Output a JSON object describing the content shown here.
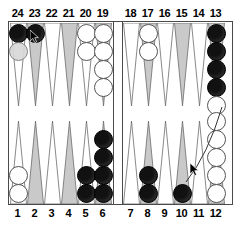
{
  "app": {
    "title": "Backgammon Board",
    "board_width": 242,
    "board_height": 227
  },
  "colors": {
    "board_background": "#ffffff",
    "border": "#4a4a4a",
    "point_shaded": "#c9c9c9",
    "point_plain": "#ffffff",
    "checker_dark": "#111111",
    "checker_light": "#ffffff",
    "checker_ghost": "#d8d8d8",
    "label_text": "#000000",
    "drag_line": "#333333"
  },
  "labels": {
    "top": [
      "24",
      "23",
      "22",
      "21",
      "20",
      "19",
      "18",
      "17",
      "16",
      "15",
      "14",
      "13"
    ],
    "bottom": [
      "1",
      "2",
      "3",
      "4",
      "5",
      "6",
      "7",
      "8",
      "9",
      "10",
      "11",
      "12"
    ]
  },
  "points": [
    {
      "number": "24",
      "row": "top",
      "quadrant": "left",
      "index": 0,
      "shaded": false,
      "checkers": [
        {
          "color": "dark"
        },
        {
          "color": "ghost"
        }
      ]
    },
    {
      "number": "23",
      "row": "top",
      "quadrant": "left",
      "index": 1,
      "shaded": true,
      "checkers": [
        {
          "color": "dark"
        }
      ]
    },
    {
      "number": "22",
      "row": "top",
      "quadrant": "left",
      "index": 2,
      "shaded": false,
      "checkers": []
    },
    {
      "number": "21",
      "row": "top",
      "quadrant": "left",
      "index": 3,
      "shaded": true,
      "checkers": []
    },
    {
      "number": "20",
      "row": "top",
      "quadrant": "left",
      "index": 4,
      "shaded": false,
      "checkers": [
        {
          "color": "light"
        },
        {
          "color": "light"
        }
      ]
    },
    {
      "number": "19",
      "row": "top",
      "quadrant": "left",
      "index": 5,
      "shaded": true,
      "checkers": [
        {
          "color": "light"
        },
        {
          "color": "light"
        },
        {
          "color": "light"
        },
        {
          "color": "light"
        }
      ]
    },
    {
      "number": "18",
      "row": "top",
      "quadrant": "right",
      "index": 6,
      "shaded": false,
      "checkers": []
    },
    {
      "number": "17",
      "row": "top",
      "quadrant": "right",
      "index": 7,
      "shaded": true,
      "checkers": [
        {
          "color": "light"
        },
        {
          "color": "light"
        }
      ]
    },
    {
      "number": "16",
      "row": "top",
      "quadrant": "right",
      "index": 8,
      "shaded": false,
      "checkers": []
    },
    {
      "number": "15",
      "row": "top",
      "quadrant": "right",
      "index": 9,
      "shaded": true,
      "checkers": []
    },
    {
      "number": "14",
      "row": "top",
      "quadrant": "right",
      "index": 10,
      "shaded": false,
      "checkers": []
    },
    {
      "number": "13",
      "row": "top",
      "quadrant": "right",
      "index": 11,
      "shaded": true,
      "checkers": [
        {
          "color": "dark"
        },
        {
          "color": "dark"
        },
        {
          "color": "dark"
        },
        {
          "color": "dark"
        },
        {
          "color": "light"
        }
      ]
    },
    {
      "number": "1",
      "row": "bottom",
      "quadrant": "left",
      "index": 0,
      "shaded": false,
      "checkers": [
        {
          "color": "light"
        },
        {
          "color": "light"
        }
      ]
    },
    {
      "number": "2",
      "row": "bottom",
      "quadrant": "left",
      "index": 1,
      "shaded": true,
      "checkers": []
    },
    {
      "number": "3",
      "row": "bottom",
      "quadrant": "left",
      "index": 2,
      "shaded": false,
      "checkers": []
    },
    {
      "number": "4",
      "row": "bottom",
      "quadrant": "left",
      "index": 3,
      "shaded": true,
      "checkers": []
    },
    {
      "number": "5",
      "row": "bottom",
      "quadrant": "left",
      "index": 4,
      "shaded": false,
      "checkers": [
        {
          "color": "dark"
        },
        {
          "color": "dark"
        }
      ]
    },
    {
      "number": "6",
      "row": "bottom",
      "quadrant": "left",
      "index": 5,
      "shaded": true,
      "checkers": [
        {
          "color": "dark"
        },
        {
          "color": "dark"
        },
        {
          "color": "dark"
        },
        {
          "color": "dark"
        }
      ]
    },
    {
      "number": "7",
      "row": "bottom",
      "quadrant": "right",
      "index": 6,
      "shaded": false,
      "checkers": []
    },
    {
      "number": "8",
      "row": "bottom",
      "quadrant": "right",
      "index": 7,
      "shaded": true,
      "checkers": [
        {
          "color": "dark"
        },
        {
          "color": "dark"
        }
      ]
    },
    {
      "number": "9",
      "row": "bottom",
      "quadrant": "right",
      "index": 8,
      "shaded": false,
      "checkers": []
    },
    {
      "number": "10",
      "row": "bottom",
      "quadrant": "right",
      "index": 9,
      "shaded": true,
      "checkers": [
        {
          "color": "dark"
        }
      ]
    },
    {
      "number": "11",
      "row": "bottom",
      "quadrant": "right",
      "index": 10,
      "shaded": false,
      "checkers": []
    },
    {
      "number": "12",
      "row": "bottom",
      "quadrant": "right",
      "index": 11,
      "shaded": true,
      "checkers": [
        {
          "color": "light"
        },
        {
          "color": "light"
        },
        {
          "color": "light"
        },
        {
          "color": "light"
        },
        {
          "color": "light"
        }
      ]
    }
  ],
  "cursors": [
    {
      "name": "pointer-on-point-23",
      "x": 30,
      "y": 30
    },
    {
      "name": "pointer-on-point-10",
      "x": 190,
      "y": 163
    }
  ],
  "drag": {
    "from_point": "10",
    "to_point": "13",
    "from_x": 186,
    "from_y": 182,
    "to_x": 222,
    "to_y": 107
  }
}
